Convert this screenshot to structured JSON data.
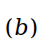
{
  "subfigure_label": {
    "open_paren": "(",
    "letter": "b",
    "close_paren": ")",
    "color": "#000000"
  }
}
